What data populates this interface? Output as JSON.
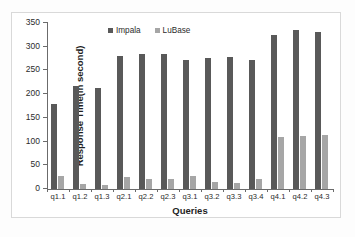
{
  "chart_data": {
    "type": "bar",
    "title": "",
    "xlabel": "Queries",
    "ylabel": "Response Time(in second)",
    "categories": [
      "q1.1",
      "q1.2",
      "q1.3",
      "q2.1",
      "q2.2",
      "q2.3",
      "q3.1",
      "q3.2",
      "q3.3",
      "q3.4",
      "q4.1",
      "q4.2",
      "q4.3"
    ],
    "series": [
      {
        "name": "Impala",
        "color": "#595959",
        "values": [
          180,
          217,
          214,
          281,
          284,
          285,
          273,
          277,
          278,
          271,
          324,
          335,
          331
        ]
      },
      {
        "name": "LuBase",
        "color": "#a6a6a6",
        "values": [
          28,
          11,
          9,
          25,
          21,
          22,
          27,
          14,
          13,
          21,
          109,
          111,
          113
        ]
      }
    ],
    "ylim": [
      0,
      350
    ],
    "yticks": [
      0,
      50,
      100,
      150,
      200,
      250,
      300,
      350
    ],
    "ytick_labels": [
      "0",
      "50",
      "100",
      "150",
      "200",
      "250",
      "300",
      "350"
    ],
    "grid": false,
    "legend_position": "top-center-left",
    "legend_entries": [
      "Impala",
      "LuBase"
    ]
  }
}
